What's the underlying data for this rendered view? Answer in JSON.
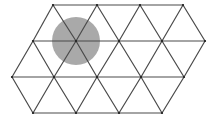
{
  "diagram": {
    "type": "triangular-lattice",
    "background": "#ffffff",
    "line_color": "#4a4a4a",
    "circle": {
      "cx": 76,
      "cy": 41,
      "r": 24,
      "fill": "#9a9a9a",
      "opacity": 0.85
    },
    "rows": [
      {
        "y": 5,
        "x": [
          53,
          97,
          140,
          183
        ]
      },
      {
        "y": 41,
        "x": [
          33,
          76,
          119,
          162,
          205
        ]
      },
      {
        "y": 77,
        "x": [
          12,
          54,
          97,
          141,
          184
        ]
      },
      {
        "y": 113,
        "x": [
          33,
          76,
          119,
          162
        ]
      }
    ],
    "segments": [
      [
        53,
        5,
        183,
        5
      ],
      [
        33,
        41,
        205,
        41
      ],
      [
        12,
        77,
        184,
        77
      ],
      [
        33,
        113,
        162,
        113
      ],
      [
        53,
        5,
        33,
        41
      ],
      [
        53,
        5,
        76,
        41
      ],
      [
        97,
        5,
        76,
        41
      ],
      [
        97,
        5,
        119,
        41
      ],
      [
        140,
        5,
        119,
        41
      ],
      [
        140,
        5,
        162,
        41
      ],
      [
        183,
        5,
        162,
        41
      ],
      [
        183,
        5,
        205,
        41
      ],
      [
        33,
        41,
        12,
        77
      ],
      [
        33,
        41,
        54,
        77
      ],
      [
        76,
        41,
        54,
        77
      ],
      [
        76,
        41,
        97,
        77
      ],
      [
        119,
        41,
        97,
        77
      ],
      [
        119,
        41,
        141,
        77
      ],
      [
        162,
        41,
        141,
        77
      ],
      [
        162,
        41,
        184,
        77
      ],
      [
        205,
        41,
        184,
        77
      ],
      [
        33,
        113,
        12,
        77
      ],
      [
        33,
        113,
        54,
        77
      ],
      [
        76,
        113,
        54,
        77
      ],
      [
        76,
        113,
        97,
        77
      ],
      [
        119,
        113,
        97,
        77
      ],
      [
        119,
        113,
        141,
        77
      ],
      [
        162,
        113,
        141,
        77
      ],
      [
        162,
        113,
        184,
        77
      ]
    ]
  }
}
